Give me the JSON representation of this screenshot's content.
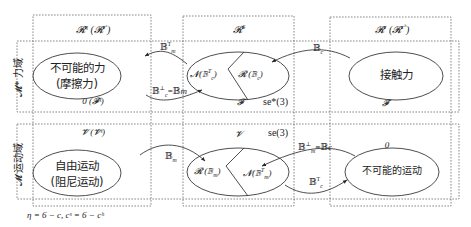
{
  "diagram": {
    "columns": [
      {
        "id": "col-left",
        "header": "𝓡",
        "header_sup": "η",
        "header_paren": "(𝓡",
        "header_paren_sup": "c",
        "header_paren_sup2": "s",
        "header_text": "ℛ^η (ℛ^{c^s})"
      },
      {
        "id": "col-center",
        "header": "𝓡",
        "header_sup": "6",
        "header_text": "ℛ^6"
      },
      {
        "id": "col-right",
        "header": "𝓡",
        "header_sup": "c",
        "header_paren": "(𝓡",
        "header_paren_sup": "c",
        "header_paren_sup2": "h",
        "header_text": "ℛ^c (ℛ^{c^h})"
      }
    ],
    "rows": [
      {
        "id": "row-force",
        "label": "𝓜* 力域",
        "left": {
          "ellipse_line1": "不可能的力",
          "ellipse_line2": "(摩擦力)",
          "caption": "0 (𝓕̄ˢ)"
        },
        "center": {
          "left_part": "𝓝(𝔹꜀ᵀ)",
          "right_part": "𝓡 (𝔹꜀)",
          "caption": "𝓕",
          "group": "se*(3)"
        },
        "right": {
          "ellipse": "接触力",
          "caption": "𝓕̄"
        },
        "arrows": [
          {
            "from": "center",
            "to": "left",
            "label": "𝔹ₘᵀ"
          },
          {
            "from": "left",
            "to": "center",
            "label": "𝔹꜀⊥=𝔹ₘ"
          },
          {
            "from": "right",
            "to": "center",
            "label": "𝔹꜀"
          }
        ]
      },
      {
        "id": "row-motion",
        "label": "𝓜 运动域",
        "left": {
          "caption": "𝓥̄ (𝓥̄ˢ)",
          "ellipse_line1": "自由运动",
          "ellipse_line2": "(阻尼运动)"
        },
        "center": {
          "caption": "𝓥",
          "group": "se(3)",
          "left_part": "𝓡 (𝔹ₘ)",
          "right_part": "𝓝(𝔹ₘᵀ)"
        },
        "right": {
          "caption": "0",
          "ellipse": "不可能的运动"
        },
        "arrows": [
          {
            "from": "left",
            "to": "center",
            "label": "𝔹ₘ"
          },
          {
            "from": "right",
            "to": "center",
            "label": "𝔹ₘ⊥=𝔹꜀"
          },
          {
            "from": "center",
            "to": "right",
            "label": "𝔹꜀ᵀ"
          }
        ]
      }
    ],
    "footnote": "η = 6 − c,     cˢ = 6 − cʰ"
  },
  "text": {
    "col_left_header": "𝓡",
    "col_left_sup": "η",
    "col_left_paren": " (𝓡",
    "col_left_paren_sup": "cˢ",
    "col_left_close": ")",
    "col_center_header": "𝓡",
    "col_center_sup": "6",
    "col_right_header": "𝓡",
    "col_right_sup": "c",
    "col_right_paren": " (𝓡",
    "col_right_paren_sup": "cʰ",
    "col_right_close": ")",
    "row_force_label": "𝓜* 力域",
    "row_motion_label": "𝓜 运动域",
    "force_left_l1": "不可能的力",
    "force_left_l2": "(摩擦力)",
    "force_left_caption": "0 (𝓕̄ˢ)",
    "force_center_left": "𝓝(𝔹",
    "force_center_left_sup": "T",
    "force_center_left_sub": "c",
    "force_center_left_close": ")",
    "force_center_right": "𝓡 (𝔹",
    "force_center_right_sub": "c",
    "force_center_right_close": ")",
    "force_center_caption": "𝓕",
    "force_group": "se*(3)",
    "force_right_ellipse": "接触力",
    "force_right_caption": "𝓕̄",
    "arrow_bmT": "𝔹",
    "arrow_bmT_sub": "m",
    "arrow_bmT_sup": "T",
    "arrow_bcperp": "𝔹",
    "arrow_bcperp_sub": "c",
    "arrow_bcperp_sup": "⊥",
    "arrow_bcperp_eq": "=𝔹",
    "arrow_bcperp_eq_sub": "m",
    "arrow_bc": "𝔹",
    "arrow_bc_sub": "c",
    "motion_left_caption": "𝓥̄  (𝓥̄ˢ)",
    "motion_left_l1": "自由运动",
    "motion_left_l2": "(阻尼运动)",
    "motion_center_caption": "𝓥",
    "motion_group": "se(3)",
    "motion_center_left": "𝓡 (𝔹",
    "motion_center_left_sub": "m",
    "motion_center_left_close": ")",
    "motion_center_right": "𝓝(𝔹",
    "motion_center_right_sup": "T",
    "motion_center_right_sub": "m",
    "motion_center_right_close": ")",
    "motion_right_caption": "0",
    "motion_right_ellipse": "不可能的运动",
    "arrow_bm": "𝔹",
    "arrow_bm_sub": "m",
    "arrow_bmperp": "𝔹",
    "arrow_bmperp_sub": "m",
    "arrow_bmperp_sup": "⊥",
    "arrow_bmperp_eq": "=𝔹",
    "arrow_bmperp_eq_sub": "c",
    "arrow_bcT": "𝔹",
    "arrow_bcT_sub": "c",
    "arrow_bcT_sup": "T",
    "footnote": "η = 6 − c,     cˢ = 6 − cʰ"
  },
  "colors": {
    "line": "#3a3a3a",
    "dashed_box": "#6b6b6b",
    "text": "#222222",
    "background": "#ffffff"
  }
}
